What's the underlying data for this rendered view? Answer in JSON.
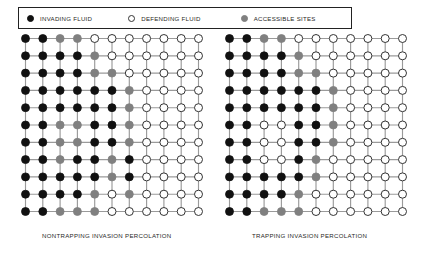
{
  "legend": {
    "entries": [
      {
        "label": "INVADING FLUID",
        "swatch": "filled-circle-icon",
        "color": "#111111"
      },
      {
        "label": "DEFENDING FLUID",
        "swatch": "open-circle-icon",
        "color": "#ffffff"
      },
      {
        "label": "ACCESSIBLE SITES",
        "swatch": "gray-circle-icon",
        "color": "#808080"
      }
    ]
  },
  "colors": {
    "invading": "#111111",
    "defending": "#ffffff",
    "accessible": "#808080",
    "bond": "#9a9a9a",
    "outline": "#333333",
    "border": "#222222"
  },
  "lattices": [
    {
      "name": "nontrapping-invasion-percolation",
      "caption": "NONTRAPPING INVASION PERCOLATION",
      "rows": 11,
      "cols": 11,
      "legend_key": {
        "I": "invading",
        "D": "defending",
        "A": "accessible"
      },
      "grid": [
        [
          "I",
          "I",
          "A",
          "A",
          "D",
          "D",
          "D",
          "D",
          "D",
          "D",
          "D"
        ],
        [
          "I",
          "I",
          "I",
          "I",
          "A",
          "D",
          "D",
          "D",
          "D",
          "D",
          "D"
        ],
        [
          "I",
          "I",
          "I",
          "I",
          "A",
          "A",
          "D",
          "D",
          "D",
          "D",
          "D"
        ],
        [
          "I",
          "I",
          "I",
          "I",
          "I",
          "I",
          "A",
          "D",
          "D",
          "D",
          "D"
        ],
        [
          "I",
          "I",
          "I",
          "I",
          "I",
          "I",
          "A",
          "D",
          "D",
          "D",
          "D"
        ],
        [
          "I",
          "I",
          "A",
          "A",
          "I",
          "I",
          "A",
          "D",
          "D",
          "D",
          "D"
        ],
        [
          "I",
          "I",
          "A",
          "A",
          "I",
          "I",
          "A",
          "D",
          "D",
          "D",
          "D"
        ],
        [
          "I",
          "I",
          "A",
          "I",
          "I",
          "A",
          "I",
          "D",
          "D",
          "D",
          "D"
        ],
        [
          "I",
          "I",
          "I",
          "I",
          "I",
          "A",
          "I",
          "D",
          "D",
          "D",
          "D"
        ],
        [
          "I",
          "I",
          "I",
          "I",
          "A",
          "D",
          "A",
          "D",
          "D",
          "D",
          "D"
        ],
        [
          "I",
          "I",
          "A",
          "A",
          "A",
          "D",
          "D",
          "D",
          "D",
          "D",
          "D"
        ]
      ]
    },
    {
      "name": "trapping-invasion-percolation",
      "caption": "TRAPPING INVASION PERCOLATION",
      "rows": 11,
      "cols": 11,
      "legend_key": {
        "I": "invading",
        "D": "defending",
        "A": "accessible"
      },
      "grid": [
        [
          "I",
          "I",
          "A",
          "A",
          "D",
          "D",
          "D",
          "D",
          "D",
          "D",
          "D"
        ],
        [
          "I",
          "I",
          "I",
          "I",
          "A",
          "D",
          "D",
          "D",
          "D",
          "D",
          "D"
        ],
        [
          "I",
          "I",
          "I",
          "I",
          "A",
          "A",
          "D",
          "D",
          "D",
          "D",
          "D"
        ],
        [
          "I",
          "I",
          "I",
          "I",
          "I",
          "I",
          "A",
          "D",
          "D",
          "D",
          "D"
        ],
        [
          "I",
          "I",
          "I",
          "I",
          "I",
          "I",
          "A",
          "D",
          "D",
          "D",
          "D"
        ],
        [
          "I",
          "I",
          "D",
          "D",
          "I",
          "I",
          "A",
          "D",
          "D",
          "D",
          "D"
        ],
        [
          "I",
          "I",
          "D",
          "D",
          "I",
          "I",
          "A",
          "D",
          "D",
          "D",
          "D"
        ],
        [
          "I",
          "I",
          "D",
          "D",
          "I",
          "A",
          "D",
          "D",
          "D",
          "D",
          "D"
        ],
        [
          "I",
          "I",
          "I",
          "I",
          "I",
          "A",
          "D",
          "D",
          "D",
          "D",
          "D"
        ],
        [
          "I",
          "I",
          "I",
          "I",
          "A",
          "D",
          "D",
          "D",
          "D",
          "D",
          "D"
        ],
        [
          "I",
          "I",
          "A",
          "A",
          "A",
          "D",
          "D",
          "D",
          "D",
          "D",
          "D"
        ]
      ]
    }
  ]
}
